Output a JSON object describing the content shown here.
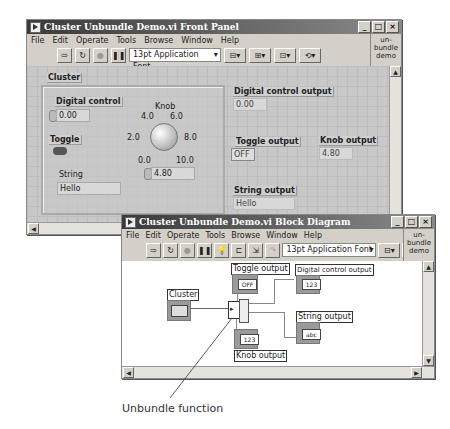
{
  "front_panel": {
    "title": "Cluster Unbundle Demo.vi Front Panel",
    "menu": [
      "File",
      "Edit",
      "Operate",
      "Tools",
      "Browse",
      "Window",
      "Help"
    ],
    "toolbar": {
      "font": "13pt Application Font"
    },
    "icon_text": "un-bundle demo",
    "cluster": {
      "label": "Cluster",
      "digital_control": {
        "label": "Digital control",
        "value": "0.00"
      },
      "knob": {
        "label": "Knob",
        "scale": [
          "0.0",
          "2.0",
          "4.0",
          "6.0",
          "8.0",
          "10.0"
        ],
        "value": "4.80"
      },
      "toggle": {
        "label": "Toggle"
      },
      "string": {
        "label": "String",
        "value": "Hello"
      }
    },
    "outputs": {
      "digital": {
        "label": "Digital control output",
        "value": "0.00"
      },
      "toggle": {
        "label": "Toggle output",
        "value": "OFF"
      },
      "knob": {
        "label": "Knob output",
        "value": "4.80"
      },
      "string": {
        "label": "String output",
        "value": "Hello"
      }
    }
  },
  "block_diagram": {
    "title": "Cluster Unbundle Demo.vi Block Diagram",
    "menu": [
      "File",
      "Edit",
      "Operate",
      "Tools",
      "Browse",
      "Window",
      "Help"
    ],
    "toolbar": {
      "font": "13pt Application Font"
    },
    "icon_text": "un-bundle demo",
    "nodes": {
      "cluster": "Cluster",
      "toggle_output": "Toggle output",
      "toggle_term": "OFF",
      "digital_output": "Digital control output",
      "digital_term": "123",
      "string_output": "String output",
      "string_term": "abc",
      "knob_output": "Knob output",
      "knob_term": "123"
    }
  },
  "annotation": "Unbundle function"
}
